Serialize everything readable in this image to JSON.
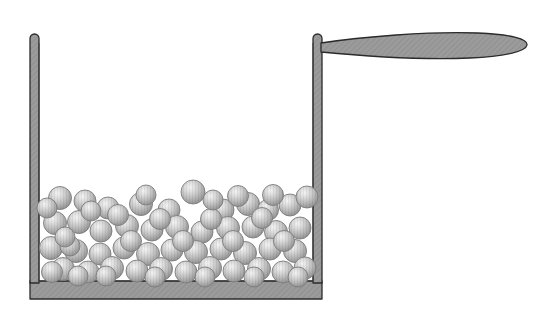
{
  "figure": {
    "type": "line-drawing-diagram",
    "width": 556,
    "height": 317,
    "background_color": "#ffffff"
  },
  "colors": {
    "outline": "#2b2b2b",
    "metal_fill": "#9b9b9b",
    "metal_fill_light": "#b4b4b4",
    "metal_hatch": "#8a8a8a",
    "sphere_light": "#f0f0f0",
    "sphere_mid": "#c2c2c2",
    "sphere_dark": "#8e8e8e",
    "sphere_outline": "#7d7d7d",
    "interior": "#ffffff"
  },
  "container": {
    "label": "vessel",
    "left_wall": {
      "x": 30,
      "y": 34,
      "width": 9,
      "height": 265,
      "cap": "rounded-top"
    },
    "right_wall": {
      "x": 313,
      "y": 34,
      "width": 9,
      "height": 265,
      "cap": "rounded-top"
    },
    "floor": {
      "x": 30,
      "y": 281,
      "width": 292,
      "height": 18
    },
    "inner_cavity": {
      "x": 39,
      "y": 43,
      "width": 274,
      "height": 238
    }
  },
  "handle": {
    "label": "handle",
    "shape": "leaf",
    "attach_x": 322,
    "attach_y": 47,
    "neck_height": 9,
    "tip_x": 527,
    "tip_y": 44,
    "max_half_height": 13
  },
  "spheres": {
    "label": "granular particles",
    "count": 67,
    "radius_range": [
      10,
      12.5
    ],
    "bed_top_y": 185,
    "bed_bottom_y": 281,
    "items": [
      {
        "cx": 60,
        "cy": 198,
        "r": 11.5
      },
      {
        "cx": 85,
        "cy": 201,
        "r": 11.0
      },
      {
        "cx": 108,
        "cy": 208,
        "r": 11.0
      },
      {
        "cx": 141,
        "cy": 204,
        "r": 11.5
      },
      {
        "cx": 169,
        "cy": 210,
        "r": 11.0
      },
      {
        "cx": 193,
        "cy": 192,
        "r": 12.0
      },
      {
        "cx": 223,
        "cy": 210,
        "r": 11.0
      },
      {
        "cx": 248,
        "cy": 204,
        "r": 11.5
      },
      {
        "cx": 268,
        "cy": 210,
        "r": 10.5
      },
      {
        "cx": 290,
        "cy": 205,
        "r": 11.0
      },
      {
        "cx": 307,
        "cy": 197,
        "r": 11.0
      },
      {
        "cx": 55,
        "cy": 223,
        "r": 11.5
      },
      {
        "cx": 79,
        "cy": 222,
        "r": 11.5
      },
      {
        "cx": 101,
        "cy": 231,
        "r": 11.0
      },
      {
        "cx": 127,
        "cy": 226,
        "r": 11.5
      },
      {
        "cx": 152,
        "cy": 230,
        "r": 11.0
      },
      {
        "cx": 177,
        "cy": 227,
        "r": 11.5
      },
      {
        "cx": 202,
        "cy": 232,
        "r": 11.0
      },
      {
        "cx": 228,
        "cy": 228,
        "r": 11.5
      },
      {
        "cx": 253,
        "cy": 227,
        "r": 11.0
      },
      {
        "cx": 276,
        "cy": 232,
        "r": 11.5
      },
      {
        "cx": 300,
        "cy": 228,
        "r": 11.0
      },
      {
        "cx": 51,
        "cy": 248,
        "r": 11.5
      },
      {
        "cx": 76,
        "cy": 251,
        "r": 11.5
      },
      {
        "cx": 100,
        "cy": 254,
        "r": 11.0
      },
      {
        "cx": 124,
        "cy": 248,
        "r": 11.0
      },
      {
        "cx": 148,
        "cy": 254,
        "r": 11.5
      },
      {
        "cx": 172,
        "cy": 250,
        "r": 11.0
      },
      {
        "cx": 196,
        "cy": 252,
        "r": 11.5
      },
      {
        "cx": 221,
        "cy": 249,
        "r": 11.0
      },
      {
        "cx": 245,
        "cy": 253,
        "r": 11.5
      },
      {
        "cx": 270,
        "cy": 249,
        "r": 11.0
      },
      {
        "cx": 295,
        "cy": 251,
        "r": 11.5
      },
      {
        "cx": 63,
        "cy": 269,
        "r": 11.5
      },
      {
        "cx": 88,
        "cy": 272,
        "r": 11.0
      },
      {
        "cx": 112,
        "cy": 268,
        "r": 11.5
      },
      {
        "cx": 137,
        "cy": 271,
        "r": 11.0
      },
      {
        "cx": 161,
        "cy": 269,
        "r": 11.5
      },
      {
        "cx": 186,
        "cy": 272,
        "r": 11.0
      },
      {
        "cx": 210,
        "cy": 268,
        "r": 11.5
      },
      {
        "cx": 234,
        "cy": 271,
        "r": 11.0
      },
      {
        "cx": 259,
        "cy": 269,
        "r": 11.5
      },
      {
        "cx": 283,
        "cy": 272,
        "r": 11.0
      },
      {
        "cx": 305,
        "cy": 268,
        "r": 11.0
      },
      {
        "cx": 52,
        "cy": 272,
        "r": 10.5
      },
      {
        "cx": 70,
        "cy": 246,
        "r": 10.0
      },
      {
        "cx": 118,
        "cy": 215,
        "r": 10.5
      },
      {
        "cx": 160,
        "cy": 219,
        "r": 10.5
      },
      {
        "cx": 211,
        "cy": 219,
        "r": 10.5
      },
      {
        "cx": 262,
        "cy": 218,
        "r": 10.5
      },
      {
        "cx": 91,
        "cy": 211,
        "r": 10.0
      },
      {
        "cx": 238,
        "cy": 196,
        "r": 10.5
      },
      {
        "cx": 131,
        "cy": 241,
        "r": 10.5
      },
      {
        "cx": 183,
        "cy": 241,
        "r": 10.5
      },
      {
        "cx": 233,
        "cy": 241,
        "r": 10.5
      },
      {
        "cx": 284,
        "cy": 241,
        "r": 10.5
      },
      {
        "cx": 65,
        "cy": 237,
        "r": 10.0
      },
      {
        "cx": 106,
        "cy": 276,
        "r": 10.0
      },
      {
        "cx": 155,
        "cy": 277,
        "r": 10.0
      },
      {
        "cx": 205,
        "cy": 277,
        "r": 10.0
      },
      {
        "cx": 254,
        "cy": 277,
        "r": 10.0
      },
      {
        "cx": 298,
        "cy": 277,
        "r": 10.0
      },
      {
        "cx": 78,
        "cy": 276,
        "r": 10.0
      },
      {
        "cx": 47,
        "cy": 208,
        "r": 10.0
      },
      {
        "cx": 273,
        "cy": 195,
        "r": 10.5
      },
      {
        "cx": 213,
        "cy": 200,
        "r": 10.0
      },
      {
        "cx": 146,
        "cy": 195,
        "r": 10.0
      }
    ]
  }
}
